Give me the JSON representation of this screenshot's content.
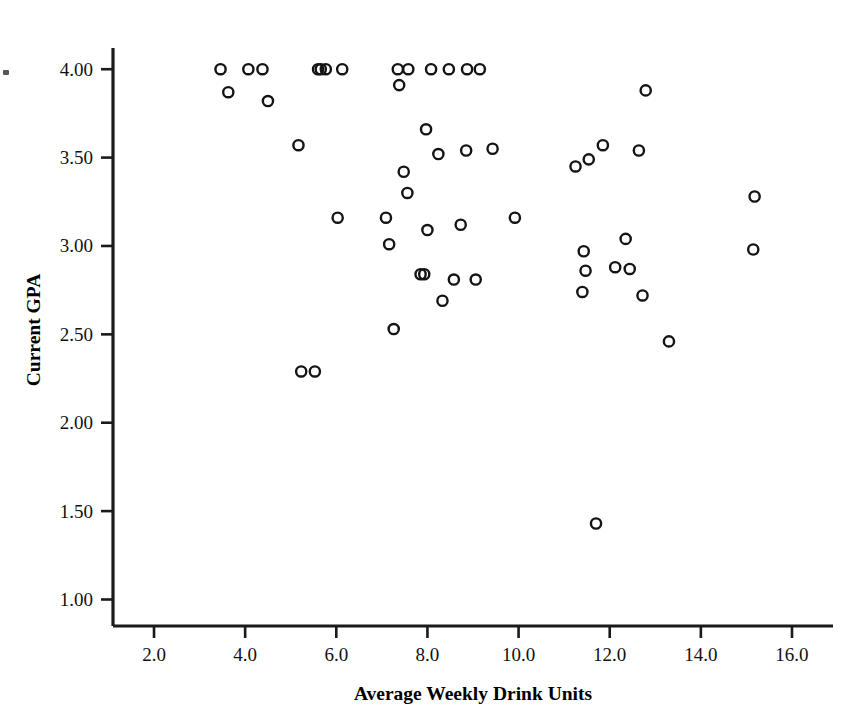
{
  "figure": {
    "background_color": "#ffffff",
    "marker_color": "#141414",
    "axis_color": "#1a1a1a",
    "marker_shape": "open-circle"
  },
  "chart_data": {
    "type": "scatter",
    "title": "",
    "xlabel": "Average Weekly Drink Units",
    "ylabel": "Current GPA",
    "xlim": [
      1.1,
      16.9
    ],
    "ylim": [
      0.85,
      4.12
    ],
    "grid": false,
    "legend": null,
    "xticks": [
      2.0,
      4.0,
      6.0,
      8.0,
      10.0,
      12.0,
      14.0,
      16.0
    ],
    "xtick_labels": [
      "2.0",
      "4.0",
      "6.0",
      "8.0",
      "10.0",
      "12.0",
      "14.0",
      "16.0"
    ],
    "yticks": [
      1.0,
      1.5,
      2.0,
      2.5,
      3.0,
      3.5,
      4.0
    ],
    "ytick_labels": [
      "1.00",
      "1.50",
      "2.00",
      "2.50",
      "3.00",
      "3.50",
      "4.00"
    ],
    "series": [
      {
        "name": "students",
        "marker": "open-circle",
        "x": [
          3.63,
          3.46,
          4.07,
          4.38,
          4.5,
          5.17,
          5.23,
          5.6,
          5.77,
          5.66,
          6.13,
          7.35,
          7.58,
          7.38,
          8.08,
          8.47,
          8.87,
          9.15,
          7.48,
          7.97,
          8.24,
          8.85,
          9.43,
          7.09,
          7.16,
          7.56,
          8.0,
          8.73,
          9.92,
          6.03,
          7.85,
          7.93,
          8.58,
          8.33,
          9.06,
          7.26,
          5.53,
          11.25,
          11.54,
          11.85,
          12.64,
          12.79,
          11.43,
          11.47,
          11.4,
          12.35,
          12.12,
          12.44,
          12.72,
          13.3,
          11.7,
          15.18,
          15.15
        ],
        "y": [
          3.87,
          4.0,
          4.0,
          4.0,
          3.82,
          3.57,
          2.29,
          4.0,
          4.0,
          4.0,
          4.0,
          4.0,
          4.0,
          3.91,
          4.0,
          4.0,
          4.0,
          4.0,
          3.42,
          3.66,
          3.52,
          3.54,
          3.55,
          3.16,
          3.01,
          3.3,
          3.09,
          3.12,
          3.16,
          3.16,
          2.84,
          2.84,
          2.81,
          2.69,
          2.81,
          2.53,
          2.29,
          3.45,
          3.49,
          3.57,
          3.54,
          3.88,
          2.97,
          2.86,
          2.74,
          3.04,
          2.88,
          2.87,
          2.72,
          2.46,
          1.43,
          3.28,
          2.98
        ]
      }
    ],
    "point_count": 53
  }
}
